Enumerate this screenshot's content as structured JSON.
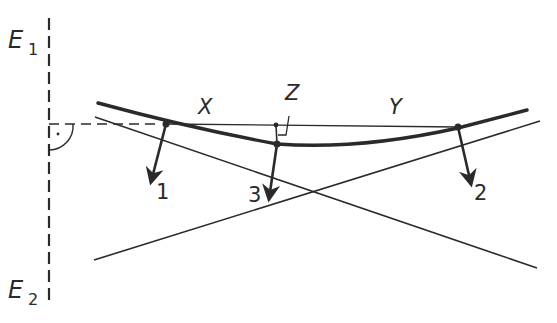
{
  "diagram": {
    "labels": {
      "e1": "E",
      "e1_sub": "1",
      "e2": "E",
      "e2_sub": "2",
      "x": "X",
      "y": "Y",
      "z": "Z",
      "p1": "1",
      "p2": "2",
      "p3": "3"
    },
    "colors": {
      "ink": "#2a2a2a",
      "background": "#ffffff"
    },
    "elements": [
      "vertical dashed plane line E1-E2",
      "horizontal dashed reference line with right-angle mark",
      "thick curved arc through points 1, 3, 2",
      "thin chord line from point 1 to point 2",
      "two crossing straight tangent lines",
      "force arrows 1, 2, 3 (normals)",
      "right-angle marker Z between chord and point 3"
    ]
  }
}
